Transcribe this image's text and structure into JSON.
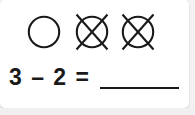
{
  "worksheet": {
    "kind": "subtraction-counting-problem",
    "background_color": "#ffffff",
    "ink_color": "#1a1a1a",
    "counters": {
      "total": 3,
      "crossed_out": 2,
      "remaining": 1,
      "items": [
        {
          "index": 1,
          "shape": "circle",
          "state": "open",
          "icon": "circle-icon"
        },
        {
          "index": 2,
          "shape": "circle",
          "state": "crossed-out",
          "icon": "circle-crossed-out-icon"
        },
        {
          "index": 3,
          "shape": "circle",
          "state": "crossed-out",
          "icon": "circle-crossed-out-icon"
        }
      ]
    },
    "equation": {
      "text": "3 – 2 = ",
      "minuend": "3",
      "operator": "–",
      "subtrahend": "2",
      "equals": "=",
      "answer": "",
      "answer_placeholder": "______"
    }
  }
}
